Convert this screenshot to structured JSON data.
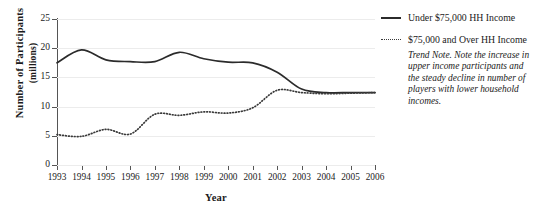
{
  "chart_data": {
    "type": "line",
    "title": "",
    "xlabel": "Year",
    "ylabel": "Number of Participants (millions)",
    "ylabel_line1": "Number of Participants",
    "ylabel_line2": "(millions)",
    "x": [
      1993,
      1994,
      1995,
      1996,
      1997,
      1998,
      1999,
      2000,
      2001,
      2002,
      2003,
      2004,
      2005,
      2006
    ],
    "categories": [
      "1993",
      "1994",
      "1995",
      "1996",
      "1997",
      "1998",
      "1999",
      "2000",
      "2001",
      "2002",
      "2003",
      "2004",
      "2005",
      "2006"
    ],
    "xlim": [
      1993,
      2006
    ],
    "ylim": [
      0,
      25
    ],
    "yticks": [
      0,
      5,
      10,
      15,
      20,
      25
    ],
    "ytick_labels": [
      "0",
      "5",
      "10",
      "15",
      "20",
      "25"
    ],
    "grid": true,
    "grid_axis": "y",
    "legend_position": "right",
    "series": [
      {
        "name": "Under $75,000 HH Income",
        "style": "solid",
        "color": "#2b2b2b",
        "values": [
          17.5,
          19.7,
          18.0,
          17.7,
          17.7,
          19.3,
          18.2,
          17.6,
          17.5,
          15.9,
          13.0,
          12.4,
          12.4,
          12.4
        ]
      },
      {
        "name": "$75,000 and Over HH Income",
        "style": "dotted",
        "color": "#3a3a3a",
        "values": [
          5.2,
          4.9,
          6.1,
          5.3,
          8.7,
          8.5,
          9.1,
          8.9,
          9.8,
          12.8,
          12.4,
          12.2,
          12.3,
          12.4
        ]
      }
    ],
    "annotations": [
      {
        "name": "trend-note",
        "text": "Trend Note. Note the increase in upper income participants and the steady decline in number of players with lower household incomes."
      }
    ]
  },
  "legend": {
    "items": [
      {
        "label": "Under $75,000 HH Income",
        "swatch": "solid-line-swatch"
      },
      {
        "label": "$75,000 and Over HH Income",
        "swatch": "dotted-line-swatch"
      }
    ]
  },
  "notes": {
    "trend_note": "Trend Note. Note the increase in upper income participants and the steady decline in number of players with lower household incomes."
  }
}
